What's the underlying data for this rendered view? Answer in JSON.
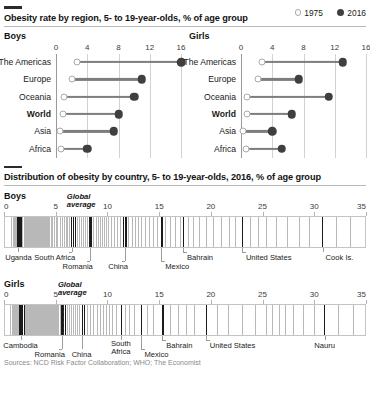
{
  "figure": {
    "legend": [
      {
        "label": "1975",
        "marker": "hollow-circle-icon",
        "color": "#ffffff"
      },
      {
        "label": "2016",
        "marker": "solid-circle-icon",
        "color": "#3f3f3f"
      }
    ],
    "source_note": "Sources: NCD Risk Factor Collaboration; WHO; The Economist"
  },
  "section1": {
    "title": "Obesity rate by region, 5- to 19-year-olds, % of age group",
    "panels": [
      {
        "name": "Boys"
      },
      {
        "name": "Girls"
      }
    ]
  },
  "section2": {
    "title": "Distribution of obesity by country, 5- to 19-year-olds, 2016, % of age group",
    "panels": [
      {
        "name": "Boys"
      },
      {
        "name": "Girls"
      }
    ],
    "global_average_label_line1": "Global",
    "global_average_label_line2": "average"
  },
  "chart_data": [
    {
      "type": "line",
      "subtype": "dumbbell-dot-plot",
      "title": "Obesity rate by region, 5- to 19-year-olds, % of age group",
      "panel": "Boys",
      "xlabel": "% of age group",
      "ylabel": "",
      "xlim": [
        0,
        16
      ],
      "xticks": [
        0,
        4,
        8,
        12,
        16
      ],
      "grid": true,
      "legend_position": "top-right",
      "categories": [
        "The Americas",
        "Europe",
        "Oceania",
        "World",
        "Asia",
        "Africa"
      ],
      "highlight_category": "World",
      "series": [
        {
          "name": "1975",
          "values": [
            2.7,
            2.1,
            1.0,
            0.9,
            0.5,
            0.7
          ]
        },
        {
          "name": "2016",
          "values": [
            16.0,
            11.0,
            10.0,
            8.0,
            7.4,
            4.0
          ]
        }
      ]
    },
    {
      "type": "line",
      "subtype": "dumbbell-dot-plot",
      "title": "Obesity rate by region, 5- to 19-year-olds, % of age group",
      "panel": "Girls",
      "xlabel": "% of age group",
      "ylabel": "",
      "xlim": [
        0,
        16
      ],
      "xticks": [
        0,
        4,
        8,
        12,
        16
      ],
      "grid": true,
      "legend_position": "top-right",
      "categories": [
        "The Americas",
        "Europe",
        "Oceania",
        "World",
        "Asia",
        "Africa"
      ],
      "highlight_category": "World",
      "series": [
        {
          "name": "1975",
          "values": [
            2.7,
            2.2,
            0.8,
            0.8,
            0.3,
            0.7
          ]
        },
        {
          "name": "2016",
          "values": [
            13.0,
            7.4,
            11.2,
            6.5,
            4.0,
            5.2
          ]
        }
      ]
    },
    {
      "type": "scatter",
      "subtype": "strip-plot",
      "title": "Distribution of obesity by country, 5- to 19-year-olds, 2016, % of age group",
      "panel": "Boys",
      "xlabel": "% of age group",
      "xlim": [
        0,
        35
      ],
      "xticks": [
        0,
        5,
        10,
        15,
        20,
        25,
        30,
        35
      ],
      "grid": false,
      "global_average": 8.2,
      "annotations": [
        {
          "label": "Uganda",
          "value": 1.4
        },
        {
          "label": "South Africa",
          "value": 6.6
        },
        {
          "label": "Romania",
          "value": 8.3
        },
        {
          "label": "China",
          "value": 11.7
        },
        {
          "label": "Mexico",
          "value": 15.2
        },
        {
          "label": "Bahrain",
          "value": 17.3
        },
        {
          "label": "United States",
          "value": 23.0
        },
        {
          "label": "Cook Is.",
          "value": 30.8
        }
      ],
      "values": [
        0.6,
        0.8,
        0.9,
        1.0,
        1.1,
        1.2,
        1.3,
        1.4,
        1.5,
        1.6,
        1.7,
        1.8,
        1.9,
        2.0,
        2.1,
        2.2,
        2.3,
        2.4,
        2.5,
        2.6,
        2.7,
        2.8,
        2.9,
        3.0,
        3.1,
        3.2,
        3.3,
        3.4,
        3.5,
        3.6,
        3.7,
        3.8,
        3.9,
        4.0,
        4.1,
        4.2,
        4.3,
        4.5,
        4.6,
        4.8,
        5.0,
        5.1,
        5.3,
        5.5,
        5.7,
        5.9,
        6.0,
        6.2,
        6.4,
        6.6,
        6.8,
        7.0,
        7.2,
        7.4,
        7.6,
        7.8,
        8.0,
        8.2,
        8.4,
        8.6,
        8.8,
        9.0,
        9.2,
        9.4,
        9.6,
        9.8,
        10.0,
        10.3,
        10.6,
        10.9,
        11.2,
        11.5,
        11.7,
        12.0,
        12.3,
        12.6,
        12.9,
        13.2,
        13.6,
        14.0,
        14.4,
        14.8,
        15.2,
        15.6,
        16.0,
        16.5,
        17.0,
        17.3,
        17.8,
        18.3,
        18.9,
        19.5,
        20.2,
        21.0,
        21.8,
        22.4,
        23.0,
        23.8,
        24.6,
        25.4,
        26.3,
        27.4,
        28.6,
        29.6,
        30.8,
        32.2,
        33.5
      ]
    },
    {
      "type": "scatter",
      "subtype": "strip-plot",
      "title": "Distribution of obesity by country, 5- to 19-year-olds, 2016, % of age group",
      "panel": "Girls",
      "xlabel": "% of age group",
      "xlim": [
        0,
        35
      ],
      "xticks": [
        0,
        5,
        10,
        15,
        20,
        25,
        30,
        35
      ],
      "grid": false,
      "global_average": 5.6,
      "annotations": [
        {
          "label": "Cambodia",
          "value": 1.6
        },
        {
          "label": "Romania",
          "value": 5.6
        },
        {
          "label": "China",
          "value": 7.5
        },
        {
          "label": "South Africa",
          "value": 11.3
        },
        {
          "label": "Mexico",
          "value": 13.2
        },
        {
          "label": "Bahrain",
          "value": 15.3
        },
        {
          "label": "United States",
          "value": 19.5
        },
        {
          "label": "Nauru",
          "value": 31.0
        }
      ],
      "values": [
        0.5,
        0.7,
        0.8,
        0.9,
        1.0,
        1.1,
        1.2,
        1.3,
        1.4,
        1.5,
        1.6,
        1.7,
        1.8,
        1.9,
        2.0,
        2.1,
        2.2,
        2.3,
        2.4,
        2.5,
        2.6,
        2.7,
        2.8,
        2.9,
        3.0,
        3.1,
        3.2,
        3.3,
        3.4,
        3.5,
        3.6,
        3.7,
        3.8,
        3.9,
        4.0,
        4.1,
        4.2,
        4.3,
        4.4,
        4.5,
        4.6,
        4.7,
        4.8,
        4.9,
        5.0,
        5.1,
        5.2,
        5.3,
        5.4,
        5.5,
        5.6,
        5.8,
        6.0,
        6.2,
        6.4,
        6.6,
        6.8,
        7.0,
        7.2,
        7.5,
        7.7,
        8.0,
        8.3,
        8.6,
        8.9,
        9.2,
        9.5,
        9.8,
        10.1,
        10.4,
        10.8,
        11.3,
        11.7,
        12.1,
        12.5,
        13.2,
        13.8,
        14.4,
        15.3,
        16.0,
        16.8,
        17.6,
        18.4,
        19.5,
        20.6,
        21.7,
        23.0,
        24.3,
        25.4,
        26.0,
        26.6,
        27.2,
        28.0,
        29.0,
        30.0,
        31.0,
        32.4,
        33.8
      ]
    }
  ]
}
